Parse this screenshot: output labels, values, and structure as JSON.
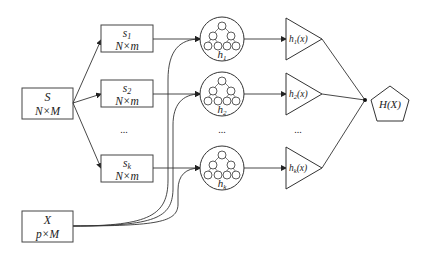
{
  "diagram": {
    "source_box": {
      "title": "S",
      "dims": "N×M"
    },
    "subsets": [
      {
        "title": "s",
        "sub": "1",
        "dims": "N×m"
      },
      {
        "title": "s",
        "sub": "2",
        "dims": "N×m"
      },
      {
        "title": "s",
        "sub": "k",
        "dims": "N×m"
      }
    ],
    "trees": [
      {
        "label": "h",
        "sub": "1"
      },
      {
        "label": "h",
        "sub": "2"
      },
      {
        "label": "h",
        "sub": "k"
      }
    ],
    "hypotheses": [
      {
        "label": "h",
        "sub": "1",
        "arg": "(x)"
      },
      {
        "label": "h",
        "sub": "2",
        "arg": "(x)"
      },
      {
        "label": "h",
        "sub": "k",
        "arg": "(x)"
      }
    ],
    "input_box": {
      "title": "X",
      "dims": "p×M"
    },
    "output": {
      "label": "H(X)"
    },
    "ellipsis": "..."
  },
  "colors": {
    "stroke": "#333333",
    "text": "#222222",
    "background": "#ffffff"
  }
}
